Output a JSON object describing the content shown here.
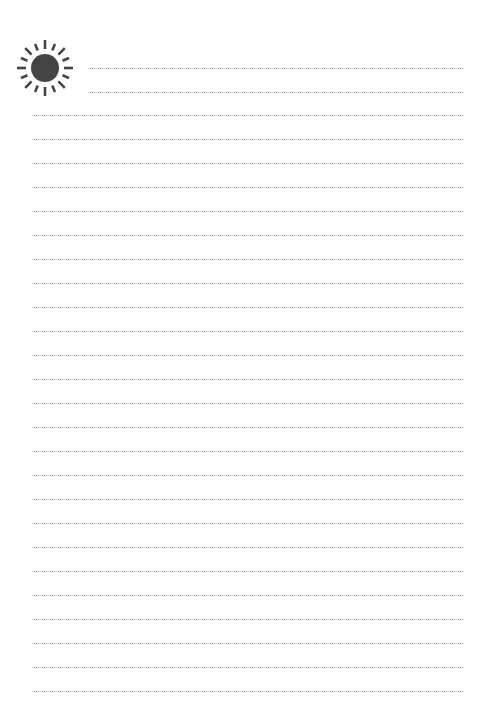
{
  "page": {
    "type": "lined-notepaper",
    "icon": "sun-icon",
    "icon_color": "#444444",
    "line_color": "#a8a8a8",
    "header_lines": [
      68,
      92
    ],
    "body_line_start": 115,
    "body_line_spacing": 24,
    "body_line_count": 25
  }
}
